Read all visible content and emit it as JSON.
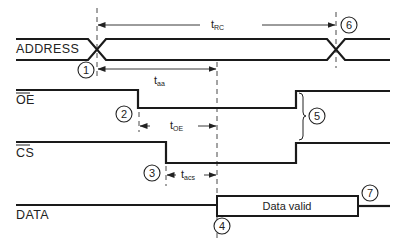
{
  "diagram": {
    "signals": [
      {
        "name": "ADDRESS",
        "label": "ADDRESS",
        "overbar": false
      },
      {
        "name": "OE",
        "label": "OE",
        "overbar": true
      },
      {
        "name": "CS",
        "label": "CS",
        "overbar": true
      },
      {
        "name": "DATA",
        "label": "DATA",
        "overbar": false
      }
    ],
    "timing_params": {
      "t_rc": {
        "base": "t",
        "sub": "RC"
      },
      "t_aa": {
        "base": "t",
        "sub": "aa"
      },
      "t_oe": {
        "base": "t",
        "sub": "OE"
      },
      "t_acs": {
        "base": "t",
        "sub": "acs"
      }
    },
    "data_box_label": "Data valid",
    "markers": [
      "1",
      "2",
      "3",
      "4",
      "5",
      "6",
      "7"
    ],
    "colors": {
      "line": "#1a1a1a",
      "background": "#ffffff"
    }
  }
}
